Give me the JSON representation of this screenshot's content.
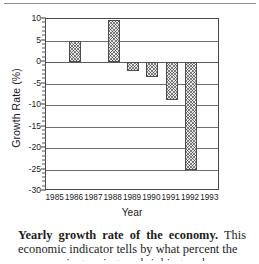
{
  "figure": {
    "y_axis_title": "Growth Rate (%)",
    "x_axis_title": "Year"
  },
  "caption": {
    "bold_lead": "Yearly growth rate of the economy.",
    "body": "This economic indicator tells by what percent the",
    "partial_next_line": "economy is growing or shrinking each year"
  },
  "chart_data": {
    "type": "bar",
    "title": "",
    "xlabel": "Year",
    "ylabel": "Growth Rate (%)",
    "categories": [
      "1985",
      "1986",
      "1987",
      "1988",
      "1989",
      "1990",
      "1991",
      "1992",
      "1993"
    ],
    "values": [
      null,
      5.0,
      null,
      9.7,
      -2.0,
      -3.6,
      -8.8,
      -25.0,
      null
    ],
    "ylim": [
      -30,
      10
    ],
    "ytick_labels": [
      "10",
      "5",
      "0",
      "-5",
      "-10",
      "-15",
      "-20",
      "-25",
      "-30"
    ],
    "ytick_values": [
      10,
      5,
      0,
      -5,
      -10,
      -15,
      -20,
      -25,
      -30
    ],
    "minor_tick_interval": 1,
    "grid": true,
    "grid_axis": "y",
    "legend": false,
    "bar_fill": "crosshatch",
    "bar_face_color": "#e6e6e6",
    "bar_edge_color": "#4d4d4d",
    "axis_color": "#4a4a4a"
  }
}
